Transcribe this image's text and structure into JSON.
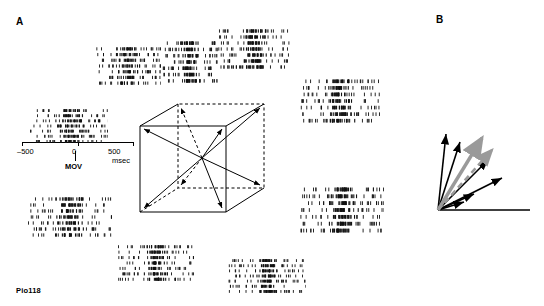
{
  "figure": {
    "panel_a_label": "A",
    "panel_b_label": "B",
    "cell_id": "Pio118"
  },
  "axis": {
    "tick_left": "–500",
    "tick_mid": "0",
    "tick_right": "500",
    "unit": "msec",
    "event_label": "MOV"
  },
  "chart_data": {
    "type": "scatter",
    "title": "",
    "xlabel": "msec",
    "ylabel": "",
    "xlim": [
      -700,
      700
    ],
    "grid": false,
    "legend": null,
    "x_axis_ticks": [
      -500,
      0,
      500
    ],
    "rasters": [
      {
        "name": "raster-upper-left-front",
        "x": 95,
        "y": 46,
        "w": 66,
        "h": 40,
        "trials": 7,
        "center_density": 0.3
      },
      {
        "name": "raster-upper-mid",
        "x": 162,
        "y": 40,
        "w": 56,
        "h": 44,
        "trials": 7,
        "center_density": 0.34
      },
      {
        "name": "raster-upper-right",
        "x": 218,
        "y": 28,
        "w": 72,
        "h": 42,
        "trials": 7,
        "center_density": 0.52
      },
      {
        "name": "raster-left-upper",
        "x": 30,
        "y": 108,
        "w": 78,
        "h": 36,
        "trials": 7,
        "center_density": 0.4
      },
      {
        "name": "raster-right-upper",
        "x": 300,
        "y": 78,
        "w": 80,
        "h": 46,
        "trials": 7,
        "center_density": 0.48
      },
      {
        "name": "raster-right-lower",
        "x": 300,
        "y": 186,
        "w": 84,
        "h": 48,
        "trials": 7,
        "center_density": 0.56
      },
      {
        "name": "raster-left-lower",
        "x": 28,
        "y": 196,
        "w": 84,
        "h": 42,
        "trials": 7,
        "center_density": 0.46
      },
      {
        "name": "raster-bottom-left",
        "x": 118,
        "y": 244,
        "w": 76,
        "h": 38,
        "trials": 7,
        "center_density": 0.44
      },
      {
        "name": "raster-bottom-right",
        "x": 228,
        "y": 258,
        "w": 78,
        "h": 36,
        "trials": 7,
        "center_density": 0.5
      }
    ]
  },
  "cube": {
    "name": "movement-direction-cube",
    "description": "Wireframe cube with solid front face edges, dashed hidden edges, and eight arrows radiating from the center toward each vertex"
  },
  "vectors": {
    "name": "population-vector-diagram",
    "description": "Fan of black cell-contribution vectors with a thick gray population vector and a dashed gray movement-direction vector",
    "colors": {
      "cell_vector": "#000000",
      "population_vector": "#9a9a9a",
      "movement_vector": "#9a9a9a"
    }
  }
}
